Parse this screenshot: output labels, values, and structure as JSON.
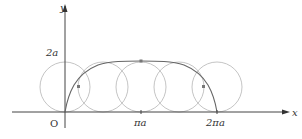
{
  "diagram": {
    "axes": {
      "x_label": "x",
      "y_label": "y",
      "origin_label": "O"
    },
    "ticks": {
      "y_tick": "2a",
      "x_tick_1": "πa",
      "x_tick_2": "2πa"
    },
    "colors": {
      "axis": "#444444",
      "curve": "#666666",
      "circle": "#bbbbbb",
      "point": "#777777"
    },
    "circles_count": 5
  }
}
